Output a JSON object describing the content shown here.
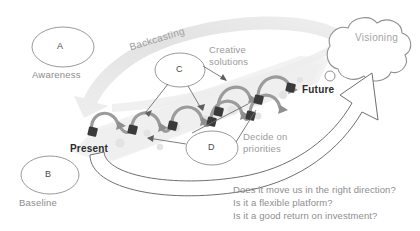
{
  "diagram": {
    "nodes": [
      {
        "id": "A",
        "letter": "A",
        "caption": "Awareness"
      },
      {
        "id": "B",
        "letter": "B",
        "caption": "Baseline"
      },
      {
        "id": "C",
        "letter": "C",
        "caption": ""
      },
      {
        "id": "D",
        "letter": "D",
        "caption": ""
      }
    ],
    "labels": {
      "backcasting": "Backcasting",
      "creative_solutions_line1": "Creative",
      "creative_solutions_line2": "solutions",
      "visioning": "Visioning",
      "present": "Present",
      "future": "Future",
      "decide_line1": "Decide on",
      "decide_line2": "priorities"
    },
    "questions": [
      "Does it move us in the right direction?",
      "Is it a flexible platform?",
      "Is it a good return on investment?"
    ],
    "colors": {
      "ellipse_stroke": "#9a9a9a",
      "chain_arrow": "#9b9b9b",
      "chain_node": "#3a3a3a",
      "swoosh_band": "#e6e6e6",
      "path_band": "#f1f1f1",
      "cloud_stroke": "#8f8f8f",
      "big_arrow_stroke": "#6f6f6f",
      "text_dark": "#2b2b2b",
      "text_gray": "#9a9a9a",
      "background": "#ffffff"
    }
  }
}
